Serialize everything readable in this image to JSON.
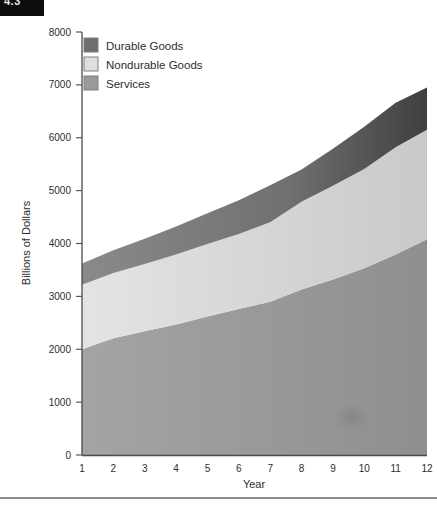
{
  "corner_tab": {
    "text": "4.3"
  },
  "chart_data": {
    "type": "area",
    "stacked": true,
    "title": "",
    "xlabel": "Year",
    "ylabel": "Billions of Dollars",
    "x": [
      1,
      2,
      3,
      4,
      5,
      6,
      7,
      8,
      9,
      10,
      11,
      12
    ],
    "xticklabels": [
      "1",
      "2",
      "3",
      "4",
      "5",
      "6",
      "7",
      "8",
      "9",
      "10",
      "11",
      "12"
    ],
    "yticks": [
      0,
      1000,
      2000,
      3000,
      4000,
      5000,
      6000,
      7000,
      8000
    ],
    "yticklabels": [
      "0",
      "1000",
      "2000",
      "3000",
      "4000",
      "5000",
      "6000",
      "7000",
      "8000"
    ],
    "ylim": [
      0,
      8000
    ],
    "xlim": [
      1,
      12
    ],
    "grid": false,
    "legend_position": "upper-left-inside",
    "series": [
      {
        "name": "Services",
        "color": "#9a9a9a",
        "values": [
          2000,
          2210,
          2340,
          2470,
          2620,
          2760,
          2900,
          3130,
          3320,
          3530,
          3790,
          4080
        ]
      },
      {
        "name": "Nondurable Goods",
        "color": "#dcdcdc",
        "values": [
          1220,
          1230,
          1270,
          1320,
          1370,
          1420,
          1500,
          1660,
          1770,
          1880,
          2030,
          2070
        ]
      },
      {
        "name": "Durable Goods",
        "color": "#6e6e6e",
        "values": [
          400,
          430,
          480,
          530,
          580,
          640,
          700,
          610,
          700,
          800,
          840,
          800
        ]
      }
    ],
    "cumulative_tops": {
      "services": [
        2000,
        2210,
        2340,
        2470,
        2620,
        2760,
        2900,
        3130,
        3320,
        3530,
        3790,
        4080
      ],
      "nondurable": [
        3220,
        3440,
        3610,
        3790,
        3990,
        4180,
        4400,
        4790,
        5090,
        5410,
        5820,
        6150
      ],
      "durable": [
        3620,
        3870,
        4090,
        4320,
        4570,
        4820,
        5100,
        5400,
        5790,
        6210,
        6660,
        6950
      ]
    }
  },
  "legend": {
    "items": [
      {
        "label": "Durable Goods",
        "color": "#6e6e6e"
      },
      {
        "label": "Nondurable Goods",
        "color": "#dedede"
      },
      {
        "label": "Services",
        "color": "#9a9a9a"
      }
    ]
  }
}
